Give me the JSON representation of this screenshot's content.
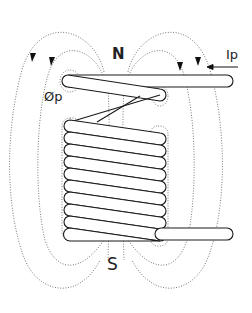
{
  "diagram": {
    "labels": {
      "north": "N",
      "south": "S",
      "flux": "Øp",
      "current": "Ip"
    },
    "coil": {
      "turns_in_stack": 10,
      "stroke_color": "#1a1a1a",
      "field_line_color": "#555555"
    }
  }
}
